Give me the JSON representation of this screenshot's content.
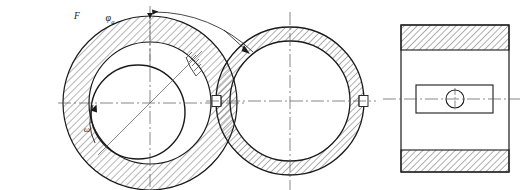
{
  "drawing": {
    "title": "Journal bearing three-view engineering drawing",
    "sheet_width": 522,
    "sheet_height": 190,
    "background_color": "#ffffff",
    "line_color": "#1a1a1a",
    "hatch_color": "#3a3a3a",
    "centerline_color": "#555555"
  },
  "views": {
    "left": {
      "name": "journal-bearing-section-view",
      "description": "Eccentric journal inside hatched bearing bush, showing oil wedge",
      "center_x": 150,
      "center_y": 103,
      "outer_radius": 87,
      "bore_radius": 61,
      "journal_radius": 47,
      "journal_center_x": 138,
      "journal_center_y": 112,
      "labels": {
        "force": "F",
        "angle": "φ",
        "angle_subscript": "a",
        "omega": "ω"
      }
    },
    "middle": {
      "name": "bearing-bush-end-view",
      "description": "Bearing bush annulus with split-line notches on horizontal centerline",
      "center_x": 290,
      "center_y": 101,
      "outer_radius": 74,
      "bore_radius": 60,
      "notch_width": 8,
      "notch_height": 11
    },
    "right": {
      "name": "bearing-front-elevation-view",
      "description": "Rectangular elevation with hatched flange bands, central boss and oil hole",
      "left": 401,
      "right": 509,
      "top": 25,
      "bottom": 172,
      "band_top_y1": 25,
      "band_top_y2": 50,
      "band_bottom_y1": 150,
      "band_bottom_y2": 172,
      "boss_left": 416,
      "boss_right": 493,
      "boss_top": 85,
      "boss_bottom": 113,
      "hole_center_x": 455,
      "hole_center_y": 99,
      "hole_radius": 9
    }
  }
}
